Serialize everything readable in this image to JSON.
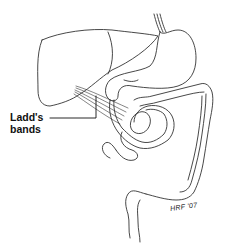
{
  "figure": {
    "structures": [
      "liver",
      "stomach",
      "esophagus",
      "duodenum",
      "small-intestine",
      "colon",
      "rectum",
      "ladds-bands"
    ],
    "colors": {
      "stroke": "#333333",
      "background": "#ffffff",
      "label": "#111111"
    }
  },
  "labels": {
    "ladds_line1": "Ladd's",
    "ladds_line2": "bands"
  },
  "signature": "HRF '07"
}
